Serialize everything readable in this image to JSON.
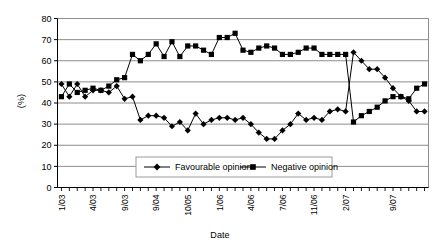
{
  "chart_data": {
    "type": "line",
    "title": "",
    "xlabel": "Date",
    "ylabel": "(%)",
    "ylim": [
      0,
      80
    ],
    "ytick_step": 10,
    "yticks": [
      0,
      10,
      20,
      30,
      40,
      50,
      60,
      70,
      80
    ],
    "grid": true,
    "legend_position": "bottom-center-inside",
    "n_points": 47,
    "xtick_labels": [
      "1/03",
      "4/03",
      "9/03",
      "9/04",
      "10/05",
      "1/06",
      "4/06",
      "7/06",
      "11/06",
      "2/07",
      "9/07"
    ],
    "xtick_indices": [
      0,
      4,
      8,
      12,
      16,
      20,
      24,
      28,
      32,
      36,
      42
    ],
    "series": [
      {
        "name": "Favourable opinion",
        "marker": "diamond",
        "color": "#000000",
        "values": [
          49,
          43,
          49,
          43,
          46,
          46,
          45,
          48,
          42,
          43,
          32,
          34,
          34,
          33,
          29,
          31,
          27,
          35,
          30,
          32,
          33,
          33,
          32,
          33,
          30,
          26,
          23,
          23,
          27,
          30,
          35,
          32,
          33,
          32,
          36,
          37,
          36,
          64,
          60,
          56,
          56,
          52,
          47,
          43,
          41,
          36,
          36
        ]
      },
      {
        "name": "Negative opinion",
        "marker": "square",
        "color": "#000000",
        "values": [
          43,
          49,
          45,
          46,
          47,
          46,
          48,
          51,
          52,
          63,
          60,
          63,
          68,
          62,
          69,
          62,
          67,
          67,
          65,
          63,
          71,
          71,
          73,
          65,
          64,
          66,
          67,
          66,
          63,
          63,
          64,
          66,
          66,
          63,
          63,
          63,
          63,
          31,
          34,
          36,
          38,
          41,
          43,
          43,
          42,
          47,
          49
        ]
      }
    ]
  },
  "legend": {
    "items": [
      {
        "label": "Favourable opinion",
        "marker": "diamond"
      },
      {
        "label": "Negative opinion",
        "marker": "square"
      }
    ]
  }
}
